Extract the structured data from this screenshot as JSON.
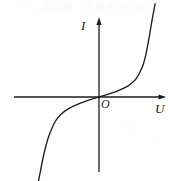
{
  "figure": {
    "name": "I-U characteristic curve",
    "background_color": "#fefefe",
    "ink_color": "#1d1d1d",
    "width": 179,
    "height": 181
  },
  "labels": {
    "y_axis": "I",
    "x_axis": "U",
    "origin": "O"
  },
  "artifacts": {
    "ghost_line_1": "一、选择题（本题共９小题）",
    "ghost_line_2": "A     B     C     D"
  },
  "chart_data": {
    "type": "line",
    "title": "",
    "xlabel": "U",
    "ylabel": "I",
    "grid": false,
    "legend": null,
    "axes": {
      "origin_label": "O",
      "x_axis_arrow": true,
      "y_axis_arrow": true,
      "x_axis_pixel_span": [
        14,
        166
      ],
      "y_axis_pixel_span": [
        18,
        172
      ],
      "origin_pixel": [
        99,
        97
      ],
      "x_tick_labels": [],
      "y_tick_labels": [],
      "xlim": [
        -1,
        1
      ],
      "ylim": [
        -1,
        1
      ]
    },
    "series": [
      {
        "name": "I(U)",
        "color": "#1d1d1d",
        "x": [
          -1.0,
          -0.95,
          -0.9,
          -0.85,
          -0.8,
          -0.7,
          -0.6,
          -0.5,
          -0.4,
          -0.3,
          -0.2,
          -0.1,
          0.0,
          0.1,
          0.2,
          0.3,
          0.4,
          0.5,
          0.6,
          0.7,
          0.75,
          0.8,
          0.85,
          0.9
        ],
        "y": [
          -1.0,
          -0.83,
          -0.66,
          -0.52,
          -0.41,
          -0.26,
          -0.18,
          -0.13,
          -0.095,
          -0.066,
          -0.042,
          -0.02,
          0.0,
          0.02,
          0.042,
          0.066,
          0.095,
          0.135,
          0.2,
          0.33,
          0.45,
          0.62,
          0.82,
          1.0
        ]
      }
    ],
    "curve_pixel_path": {
      "start": [
        16,
        178
      ],
      "end": [
        139,
        8
      ],
      "passes_through_origin": true
    }
  }
}
